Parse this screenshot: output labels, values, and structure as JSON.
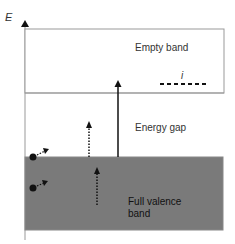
{
  "diagram": {
    "axis_label": "E",
    "regions": {
      "empty_band": "Empty band",
      "energy_gap": "Energy gap",
      "valence_band_line1": "Full valence",
      "valence_band_line2": "band"
    },
    "impurity_level_label": "i",
    "colors": {
      "valence_fill": "#7a7a7a",
      "line": "#888888",
      "arrow": "#111111"
    }
  }
}
